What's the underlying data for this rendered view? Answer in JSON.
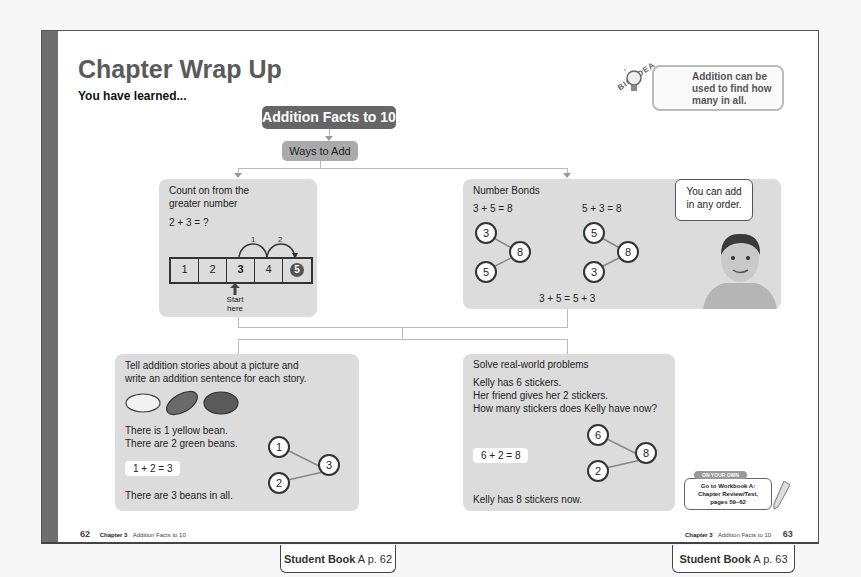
{
  "header": {
    "title": "Chapter Wrap Up",
    "subtitle": "You have learned..."
  },
  "big_idea": {
    "label": "BIG IDEA",
    "icon": "lightbulb-icon",
    "lines": [
      "Addition can be",
      "used to find how",
      "many in all."
    ]
  },
  "concept_map": {
    "topic": "Addition Facts to 10",
    "subtopic": "Ways to Add"
  },
  "panels": {
    "count_on": {
      "heading_line1": "Count on from the",
      "heading_line2": "greater number",
      "equation": "2 + 3 = ?",
      "numbers": [
        "1",
        "2",
        "3",
        "4",
        "5"
      ],
      "hop_labels": [
        "1",
        "2"
      ],
      "start_line1": "Start",
      "start_line2": "here"
    },
    "number_bonds": {
      "heading": "Number Bonds",
      "eq1": "3 + 5 = 8",
      "eq2": "5 + 3 = 8",
      "bond1": {
        "part1": "3",
        "part2": "5",
        "whole": "8"
      },
      "bond2": {
        "part1": "5",
        "part2": "3",
        "whole": "8"
      },
      "summary": "3 + 5 = 5 + 3",
      "speech_line1": "You can add",
      "speech_line2": "in any order."
    },
    "stories": {
      "heading_line1": "Tell addition stories about a picture and",
      "heading_line2": "write an addition sentence for each story.",
      "line1": "There is 1 yellow bean.",
      "line2": "There are 2 green beans.",
      "equation": "1 + 2 = 3",
      "conclusion": "There are 3 beans in all.",
      "bond": {
        "part1": "1",
        "part2": "2",
        "whole": "3"
      }
    },
    "real_world": {
      "heading": "Solve real-world problems",
      "line1": "Kelly has 6 stickers.",
      "line2": "Her friend gives her 2 stickers.",
      "line3": "How many stickers does Kelly have now?",
      "equation": "6 + 2 = 8",
      "conclusion": "Kelly has 8 stickers now.",
      "bond": {
        "part1": "6",
        "part2": "2",
        "whole": "8"
      }
    }
  },
  "on_your_own": {
    "tag": "ON YOUR OWN",
    "line1": "Go to Workbook A:",
    "line2": "Chapter Review/Test,",
    "line3": "pages 59–62"
  },
  "footer": {
    "left_page": "62",
    "right_page": "63",
    "chapter": "Chapter 3",
    "chapter_title": "Addition Facts to 10"
  },
  "tags": {
    "left": {
      "book": "Student Book",
      "letter": "A",
      "page": "p. 62"
    },
    "right": {
      "book": "Student Book",
      "letter": "A",
      "page": "p. 63"
    }
  }
}
